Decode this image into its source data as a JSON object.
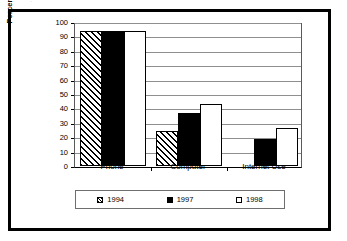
{
  "figure": {
    "bleed_text": "."
  },
  "chart_data": {
    "type": "bar",
    "title": "",
    "subtitle": "",
    "xlabel": "",
    "ylabel": "Percent of U.S. Households",
    "categories": [
      "Phone",
      "Computer",
      "Internet Use"
    ],
    "series": [
      {
        "name": "1994",
        "values": [
          94,
          24.5,
          null
        ],
        "fill": "diagonal-hatch",
        "color": "#000000"
      },
      {
        "name": "1997",
        "values": [
          94,
          37,
          19
        ],
        "fill": "solid",
        "color": "#000000"
      },
      {
        "name": "1998",
        "values": [
          94,
          43,
          26.5
        ],
        "fill": "open",
        "color": "#ffffff"
      }
    ],
    "ylim": [
      0,
      100
    ],
    "ytick_step": 10,
    "ytick_labels": [
      "100",
      "90",
      "80",
      "70",
      "60",
      "50",
      "40",
      "30",
      "20",
      "10",
      "0"
    ],
    "grid": true,
    "grid_axis": "y",
    "legend_position": "bottom",
    "legend_entries": [
      "1994",
      "1997",
      "1998"
    ]
  }
}
